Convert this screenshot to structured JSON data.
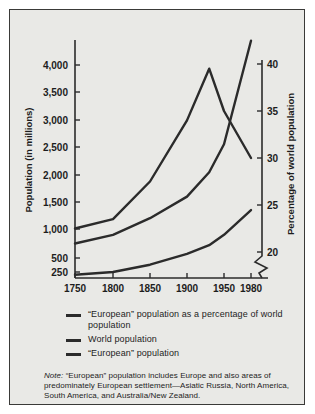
{
  "figure": {
    "background": "#e9e9e6",
    "border_color": "#3a3a38",
    "line_color": "#2b2b2b"
  },
  "legend": {
    "items": [
      {
        "label": "“European” population as a percentage of world population",
        "swatch": "line-swatch"
      },
      {
        "label": "World population",
        "swatch": "line-swatch"
      },
      {
        "label": "“European” population",
        "swatch": "line-swatch"
      }
    ]
  },
  "note": {
    "label": "Note:",
    "body": " “European” population includes Europe and also areas of predominately European settlement—Asiatic Russia, North America, South America, and Australia/New Zealand."
  },
  "chart_data": {
    "type": "line",
    "title": "",
    "xlabel": "",
    "ylabel": "Population (in millions)",
    "y2label": "Percentage of world population",
    "x": [
      1750,
      1800,
      1850,
      1900,
      1930,
      1950,
      1980
    ],
    "xticks": [
      1750,
      1800,
      1850,
      1900,
      1950,
      1980
    ],
    "xtick_labels": [
      "1750",
      "1800",
      "1850",
      "1900",
      "1950",
      "1980"
    ],
    "yticks": [
      250,
      500,
      1000,
      1500,
      2000,
      2500,
      3000,
      3500,
      4000
    ],
    "ytick_labels": [
      "250",
      "500",
      "1,000",
      "1,500",
      "2,000",
      "2,500",
      "3,000",
      "3,500",
      "4,000"
    ],
    "ylim": [
      250,
      4000
    ],
    "y2ticks": [
      20,
      25,
      30,
      35,
      40
    ],
    "y2tick_labels": [
      "20",
      "25",
      "30",
      "35",
      "40"
    ],
    "y2lim": [
      20,
      40
    ],
    "y2_axis_break": true,
    "grid": false,
    "legend_position": "below",
    "series": [
      {
        "name": "“European” population as a percentage of world population",
        "axis": "right",
        "unit": "percent",
        "x": [
          1750,
          1800,
          1850,
          1900,
          1930,
          1950,
          1980
        ],
        "values": [
          22.5,
          23.5,
          27.5,
          34.0,
          39.5,
          35.0,
          30.0
        ]
      },
      {
        "name": "World population",
        "axis": "left",
        "unit": "millions",
        "x": [
          1750,
          1800,
          1850,
          1900,
          1930,
          1950,
          1980
        ],
        "values": [
          750,
          900,
          1200,
          1600,
          2050,
          2550,
          4450
        ]
      },
      {
        "name": "“European” population",
        "axis": "left",
        "unit": "millions",
        "x": [
          1750,
          1800,
          1850,
          1900,
          1930,
          1950,
          1980
        ],
        "values": [
          200,
          250,
          380,
          570,
          720,
          900,
          1350
        ]
      }
    ]
  }
}
